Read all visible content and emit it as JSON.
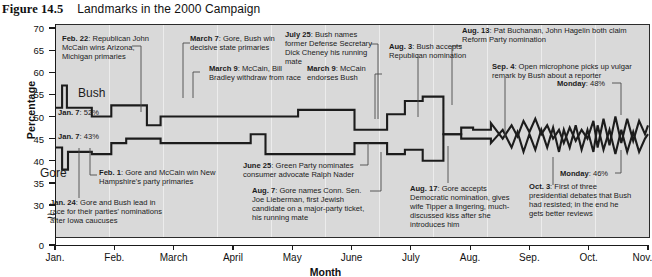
{
  "caption": {
    "figure_label": "Figure 14.5",
    "figure_label_caps": "F",
    "title": "Landmarks in the 2000 Campaign"
  },
  "chart_data": {
    "type": "line",
    "title": "Landmarks in the 2000 Campaign",
    "xlabel": "Month",
    "ylabel": "Percentage",
    "ylim": [
      0,
      70
    ],
    "y_break_between": [
      0,
      30
    ],
    "yticks": [
      70,
      65,
      60,
      55,
      50,
      45,
      40,
      35,
      30,
      0
    ],
    "xticks": [
      "Jan.",
      "Feb.",
      "March",
      "April",
      "May",
      "June",
      "July",
      "Aug.",
      "Sep.",
      "Oct.",
      "Nov."
    ],
    "grid": false,
    "legend": "inline-labels",
    "series": [
      {
        "name": "Bush",
        "start_value": 52,
        "end_value": 48,
        "points": [
          [
            0.0,
            52
          ],
          [
            0.12,
            52
          ],
          [
            0.12,
            57
          ],
          [
            0.2,
            57
          ],
          [
            0.2,
            52
          ],
          [
            0.62,
            52
          ],
          [
            0.62,
            50
          ],
          [
            0.95,
            50
          ],
          [
            0.95,
            52.5
          ],
          [
            1.2,
            52.5
          ],
          [
            1.2,
            52.5
          ],
          [
            1.55,
            52.5
          ],
          [
            1.55,
            48
          ],
          [
            1.78,
            48
          ],
          [
            1.78,
            50
          ],
          [
            2.55,
            50
          ],
          [
            2.55,
            50
          ],
          [
            3.3,
            50
          ],
          [
            3.3,
            50
          ],
          [
            4.1,
            50
          ],
          [
            4.1,
            51.5
          ],
          [
            5.05,
            51.5
          ],
          [
            5.05,
            47
          ],
          [
            5.6,
            47
          ],
          [
            5.6,
            50.5
          ],
          [
            5.9,
            50.5
          ],
          [
            5.9,
            53.5
          ],
          [
            6.2,
            53.5
          ],
          [
            6.2,
            54.5
          ],
          [
            6.55,
            54.5
          ],
          [
            6.55,
            46
          ],
          [
            6.85,
            46
          ],
          [
            6.85,
            47.5
          ],
          [
            7.05,
            47.5
          ],
          [
            7.05,
            47
          ],
          [
            7.35,
            47
          ],
          [
            7.35,
            48.5
          ],
          [
            7.55,
            45
          ],
          [
            7.7,
            48
          ],
          [
            7.8,
            45.5
          ],
          [
            7.9,
            49
          ],
          [
            8.0,
            46.5
          ],
          [
            8.1,
            49.5
          ],
          [
            8.2,
            46
          ],
          [
            8.3,
            48
          ],
          [
            8.4,
            45
          ],
          [
            8.5,
            47
          ],
          [
            8.58,
            44
          ],
          [
            8.68,
            47.5
          ],
          [
            8.78,
            44.5
          ],
          [
            8.88,
            47
          ],
          [
            8.98,
            45
          ],
          [
            9.08,
            49
          ],
          [
            9.15,
            43
          ],
          [
            9.25,
            49.5
          ],
          [
            9.35,
            43.5
          ],
          [
            9.45,
            50
          ],
          [
            9.55,
            44
          ],
          [
            9.65,
            49.5
          ],
          [
            9.75,
            44.5
          ],
          [
            9.85,
            49
          ],
          [
            9.95,
            46
          ],
          [
            10.0,
            48
          ]
        ]
      },
      {
        "name": "Gore",
        "start_value": 43,
        "end_value": 46,
        "points": [
          [
            0.0,
            43
          ],
          [
            0.12,
            43
          ],
          [
            0.12,
            38
          ],
          [
            0.22,
            38
          ],
          [
            0.22,
            42
          ],
          [
            0.62,
            42
          ],
          [
            0.62,
            41.5
          ],
          [
            0.95,
            41.5
          ],
          [
            0.95,
            44
          ],
          [
            1.2,
            44
          ],
          [
            1.2,
            45
          ],
          [
            1.55,
            45
          ],
          [
            1.55,
            45
          ],
          [
            1.78,
            45
          ],
          [
            1.78,
            44
          ],
          [
            2.55,
            44
          ],
          [
            2.55,
            44
          ],
          [
            3.3,
            44
          ],
          [
            3.3,
            46
          ],
          [
            3.55,
            46
          ],
          [
            3.55,
            41.5
          ],
          [
            4.1,
            41.5
          ],
          [
            4.1,
            41.5
          ],
          [
            5.05,
            41.5
          ],
          [
            5.05,
            44
          ],
          [
            5.6,
            44
          ],
          [
            5.6,
            41.5
          ],
          [
            5.9,
            41.5
          ],
          [
            5.9,
            42.5
          ],
          [
            6.2,
            42.5
          ],
          [
            6.2,
            40
          ],
          [
            6.55,
            40
          ],
          [
            6.55,
            46
          ],
          [
            6.85,
            46
          ],
          [
            6.85,
            45
          ],
          [
            7.05,
            45
          ],
          [
            7.05,
            45
          ],
          [
            7.35,
            45
          ],
          [
            7.35,
            44
          ],
          [
            7.55,
            47
          ],
          [
            7.7,
            43
          ],
          [
            7.8,
            46.5
          ],
          [
            7.9,
            42
          ],
          [
            8.0,
            46
          ],
          [
            8.1,
            42.5
          ],
          [
            8.2,
            47
          ],
          [
            8.3,
            43
          ],
          [
            8.4,
            47.5
          ],
          [
            8.5,
            42
          ],
          [
            8.58,
            47
          ],
          [
            8.68,
            43
          ],
          [
            8.78,
            48
          ],
          [
            8.88,
            42.5
          ],
          [
            8.98,
            47
          ],
          [
            9.08,
            42
          ],
          [
            9.15,
            48
          ],
          [
            9.25,
            42.5
          ],
          [
            9.35,
            47
          ],
          [
            9.45,
            41.5
          ],
          [
            9.55,
            47
          ],
          [
            9.65,
            42
          ],
          [
            9.75,
            46.5
          ],
          [
            9.85,
            42
          ],
          [
            9.95,
            45
          ],
          [
            10.0,
            46
          ]
        ]
      }
    ]
  },
  "series_labels": {
    "bush": "Bush",
    "gore": "Gore"
  },
  "point_labels": [
    {
      "bold": "Jan. 7",
      "rest": ": 52%"
    },
    {
      "bold": "Jan. 7",
      "rest": ": 43%"
    },
    {
      "bold": "Monday",
      "rest": ": 48%"
    },
    {
      "bold": "Monday",
      "rest": ": 46%"
    }
  ],
  "annotations": [
    {
      "bold": "Feb. 22",
      "rest": ": Republican John McCain wins Arizona, Michigan primaries"
    },
    {
      "bold": "March 7",
      "rest": ": Gore, Bush win decisive state primaries"
    },
    {
      "bold": "July 25",
      "rest": ": Bush names former Defense Secretary Dick Cheney his running mate"
    },
    {
      "bold": "Aug. 3",
      "rest": ": Bush accepts Republican nomination"
    },
    {
      "bold": "Aug. 13",
      "rest": ": Pat Buchanan, John Hagelin both claim Reform Party nomination"
    },
    {
      "bold": "March 9",
      "rest": ": McCain, Bill Bradley withdraw from race"
    },
    {
      "bold": "March 9",
      "rest": ": McCain endorses Bush"
    },
    {
      "bold": "Sep. 4",
      "rest": ": Open microphone picks up vulgar remark by Bush about a reporter"
    },
    {
      "bold": "Feb. 1",
      "rest": ": Gore and McCain win New Hampshire's party primaries"
    },
    {
      "bold": "Jan. 24",
      "rest": ": Gore and Bush lead in race for their parties' nominations after Iowa caucuses"
    },
    {
      "bold": "June 25",
      "rest": ": Green Party nominates consumer advocate Ralph Nader"
    },
    {
      "bold": "Aug. 7",
      "rest": ": Gore names Conn. Sen. Joe Lieberman, first Jewish candidate on a major-party ticket, his running mate"
    },
    {
      "bold": "Aug. 17",
      "rest": ": Gore accepts Democratic nomination, gives wife Tipper a lingering, much-discussed kiss after she introduces him"
    },
    {
      "bold": "Oct. 3",
      "rest": ": First of three presidential debates that Bush had resisted; in the end he gets better reviews"
    }
  ],
  "colors": {
    "plot_background": "#d9d9d9",
    "line": "#1c1c1c",
    "frame": "#2b2b2b",
    "page": "#ffffff"
  }
}
